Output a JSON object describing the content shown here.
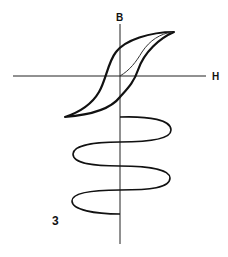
{
  "figure": {
    "number": "3",
    "axes": {
      "vertical_label": "B",
      "horizontal_label": "H"
    },
    "elements": [
      "hysteresis-loop",
      "initial-magnetization-curve",
      "decaying-spiral-winding"
    ]
  }
}
